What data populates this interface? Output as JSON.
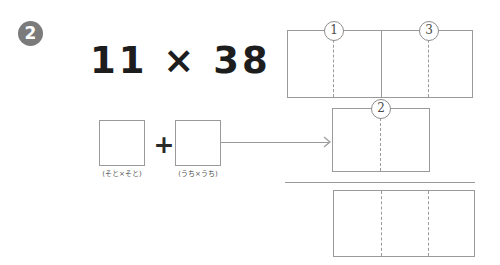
{
  "worksheet": {
    "problem_number": "2",
    "equation": "11 × 38 =",
    "multiplicand": "11",
    "multiplier": "38",
    "operator": "×",
    "equals": "=",
    "plus": "+",
    "colors": {
      "badge_fill": "#7b7b7b",
      "badge_text": "#ffffff",
      "line": "#9a9a9a",
      "text": "#1d1d1d",
      "caption_text": "#555555"
    }
  },
  "boxes": [
    {
      "name": "soto",
      "caption": "(そと×そと)"
    },
    {
      "name": "uchi",
      "caption": "(うち×うち)"
    }
  ],
  "step_markers": {
    "one": "①",
    "two": "②",
    "three": "③",
    "one_plain": "1",
    "two_plain": "2",
    "three_plain": "3"
  },
  "arrow": {
    "icon": "arrow-right-icon"
  }
}
